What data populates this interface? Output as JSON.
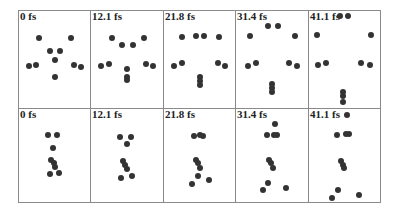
{
  "figure": {
    "rows": [
      {
        "name": "top-row",
        "panels": [
          {
            "label": "0 fs",
            "dots": [
              [
                20,
                27
              ],
              [
                52,
                27
              ],
              [
                31,
                40
              ],
              [
                41,
                40
              ],
              [
                36,
                49
              ],
              [
                10,
                55
              ],
              [
                17,
                54
              ],
              [
                55,
                54
              ],
              [
                62,
                56
              ],
              [
                36,
                66
              ]
            ]
          },
          {
            "label": "12.1 fs",
            "dots": [
              [
                21,
                27
              ],
              [
                53,
                27
              ],
              [
                31,
                34
              ],
              [
                42,
                34
              ],
              [
                10,
                55
              ],
              [
                18,
                53
              ],
              [
                55,
                53
              ],
              [
                62,
                55
              ],
              [
                36,
                58
              ],
              [
                36,
                66
              ],
              [
                36,
                69
              ]
            ]
          },
          {
            "label": "21.8 fs",
            "dots": [
              [
                18,
                26
              ],
              [
                32,
                25
              ],
              [
                40,
                25
              ],
              [
                55,
                26
              ],
              [
                10,
                55
              ],
              [
                18,
                52
              ],
              [
                54,
                52
              ],
              [
                61,
                55
              ],
              [
                36,
                66
              ],
              [
                36,
                70
              ],
              [
                36,
                74
              ]
            ]
          },
          {
            "label": "31.4 fs",
            "dots": [
              [
                32,
                15
              ],
              [
                42,
                15
              ],
              [
                14,
                25
              ],
              [
                59,
                25
              ],
              [
                12,
                55
              ],
              [
                20,
                52
              ],
              [
                53,
                52
              ],
              [
                61,
                55
              ],
              [
                36,
                73
              ],
              [
                36,
                77
              ],
              [
                36,
                81
              ]
            ]
          },
          {
            "label": "41.1 fs",
            "dots": [
              [
                31,
                5
              ],
              [
                39,
                5
              ],
              [
                8,
                24
              ],
              [
                62,
                24
              ],
              [
                9,
                54
              ],
              [
                17,
                52
              ],
              [
                52,
                52
              ],
              [
                61,
                54
              ],
              [
                34,
                81
              ],
              [
                34,
                85
              ],
              [
                34,
                91
              ]
            ]
          }
        ]
      },
      {
        "name": "bottom-row",
        "panels": [
          {
            "label": "0 fs",
            "dots": [
              [
                29,
                26
              ],
              [
                38,
                26
              ],
              [
                34,
                39
              ],
              [
                32,
                51
              ],
              [
                35,
                54
              ],
              [
                36,
                58
              ],
              [
                31,
                65
              ],
              [
                40,
                64
              ]
            ]
          },
          {
            "label": "12.1 fs",
            "dots": [
              [
                29,
                28
              ],
              [
                40,
                28
              ],
              [
                36,
                35
              ],
              [
                32,
                52
              ],
              [
                34,
                56
              ],
              [
                36,
                60
              ],
              [
                30,
                69
              ],
              [
                41,
                67
              ]
            ]
          },
          {
            "label": "21.8 fs",
            "dots": [
              [
                30,
                27
              ],
              [
                36,
                26
              ],
              [
                39,
                27
              ],
              [
                32,
                51
              ],
              [
                34,
                54
              ],
              [
                36,
                59
              ],
              [
                34,
                67
              ],
              [
                28,
                75
              ],
              [
                45,
                71
              ]
            ]
          },
          {
            "label": "31.4 fs",
            "dots": [
              [
                39,
                15
              ],
              [
                31,
                26
              ],
              [
                38,
                26
              ],
              [
                41,
                26
              ],
              [
                33,
                51
              ],
              [
                35,
                54
              ],
              [
                37,
                59
              ],
              [
                32,
                74
              ],
              [
                27,
                81
              ],
              [
                50,
                79
              ]
            ]
          },
          {
            "label": "41.1 fs",
            "dots": [
              [
                38,
                6
              ],
              [
                28,
                26
              ],
              [
                37,
                25
              ],
              [
                40,
                25
              ],
              [
                32,
                52
              ],
              [
                34,
                56
              ],
              [
                35,
                59
              ],
              [
                29,
                81
              ],
              [
                23,
                89
              ],
              [
                50,
                86
              ]
            ]
          }
        ]
      }
    ],
    "colors": {
      "border": "#8a8a8a",
      "dot": "#333333",
      "label": "#222222"
    }
  }
}
